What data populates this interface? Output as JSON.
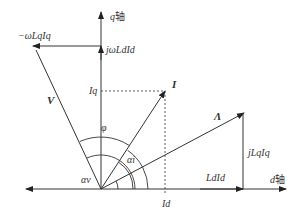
{
  "diagram": {
    "type": "phasor-diagram",
    "axes": {
      "q_axis": {
        "label": "q",
        "suffix": "轴"
      },
      "d_axis": {
        "label": "d",
        "suffix": "轴"
      }
    },
    "vectors": {
      "voltage": {
        "label": "V"
      },
      "current": {
        "label": "I"
      },
      "flux": {
        "label": "Λ"
      }
    },
    "components": {
      "neg_omega_Lq_Iq": "−ωLqIq",
      "j_omega_Ld_Id": "jωLdId",
      "Ld_Id": "LdId",
      "j_Lq_Iq": "jLqIq",
      "Iq": "Iq",
      "Id": "Id"
    },
    "angles": {
      "phi": "φ",
      "alpha_v": "αv",
      "alpha_i": "αi",
      "alpha_superscript": "e"
    },
    "colors": {
      "line": "#333333",
      "background": "#ffffff"
    }
  }
}
